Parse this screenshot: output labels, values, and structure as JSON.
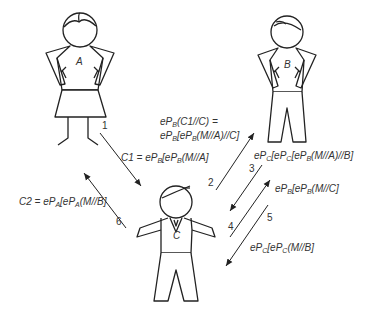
{
  "figures": {
    "a": {
      "label": "A"
    },
    "b": {
      "label": "B"
    },
    "c": {
      "label": "C"
    }
  },
  "steps": {
    "s1": "1",
    "s2": "2",
    "s3": "3",
    "s4": "4",
    "s5": "5",
    "s6": "6"
  },
  "messages": {
    "c1": {
      "prefix": "C1 = eP",
      "sub1": "B",
      "mid": "[eP",
      "sub2": "B",
      "suffix": "(M//A]"
    },
    "to_b_line1": {
      "prefix": "eP",
      "sub1": "B",
      "suffix": "(C1//C) ="
    },
    "to_b_line2": {
      "prefix": "eP",
      "sub1": "B",
      "mid": "[eP",
      "sub2": "B",
      "suffix": "(M//A)//C]"
    },
    "from_b": {
      "prefix": "eP",
      "sub1": "C",
      "mid": "[eP",
      "sub2": "C",
      "mid2": "[eP",
      "sub3": "B",
      "suffix": "(M//A)//B]"
    },
    "to_b_again": {
      "prefix": "eP",
      "sub1": "B",
      "mid": "[eP",
      "sub2": "B",
      "suffix": "(M//C]"
    },
    "from_b_again": {
      "prefix": "eP",
      "sub1": "C",
      "mid": "[eP",
      "sub2": "C",
      "suffix": "(M//B]"
    },
    "c2": {
      "prefix": "C2 = eP",
      "sub1": "A",
      "mid": "[eP",
      "sub2": "A",
      "suffix": "(M//B]"
    }
  },
  "colors": {
    "stroke": "#222222",
    "text": "#333333",
    "background": "#ffffff"
  }
}
